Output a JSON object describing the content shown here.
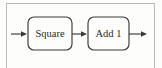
{
  "figure": {
    "background_color": "#fdfdfc",
    "frame_color": "#b9b9b5",
    "line_color": "#3a3a38",
    "text_color": "#2a2a28"
  },
  "blocks": [
    {
      "id": "square",
      "label": "Square"
    },
    {
      "id": "add1",
      "label": "Add 1"
    }
  ],
  "connectors": [
    {
      "id": "input-arrow",
      "from": "external-input",
      "to": "square",
      "direction": "right"
    },
    {
      "id": "link-arrow",
      "from": "square",
      "to": "add1",
      "direction": "right"
    },
    {
      "id": "output-arrow",
      "from": "add1",
      "to": "external-output",
      "direction": "right"
    }
  ]
}
